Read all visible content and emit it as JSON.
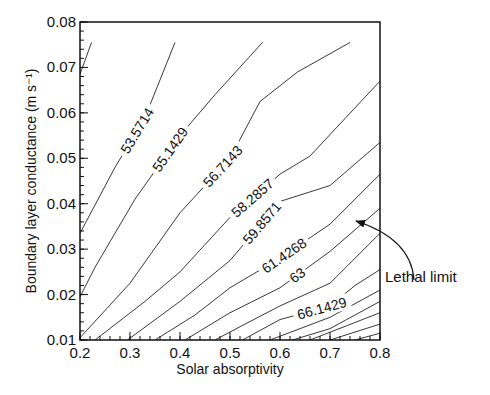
{
  "chart_data": {
    "type": "contour",
    "title": "",
    "xlabel": "Solar absorptivity",
    "ylabel": "Boundary layer conductance (m s⁻¹)",
    "xlim": [
      0.2,
      0.8
    ],
    "ylim": [
      0.01,
      0.08
    ],
    "xticks": [
      "0.2",
      "0.3",
      "0.4",
      "0.5",
      "0.6",
      "0.7",
      "0.8"
    ],
    "yticks": [
      "0.01",
      "0.02",
      "0.03",
      "0.04",
      "0.05",
      "0.06",
      "0.07",
      "0.08"
    ],
    "grid": false,
    "levels": [
      {
        "value": 52.0,
        "label": "",
        "points": [
          [
            0.2,
            0.0685
          ],
          [
            0.223,
            0.0755
          ]
        ]
      },
      {
        "value": 53.5714,
        "label": "53.5714",
        "points": [
          [
            0.2,
            0.0335
          ],
          [
            0.27,
            0.048
          ],
          [
            0.33,
            0.059
          ],
          [
            0.39,
            0.0755
          ]
        ]
      },
      {
        "value": 55.1429,
        "label": "55.1429",
        "points": [
          [
            0.2,
            0.0195
          ],
          [
            0.23,
            0.026
          ],
          [
            0.31,
            0.041
          ],
          [
            0.4,
            0.055
          ],
          [
            0.47,
            0.064
          ],
          [
            0.565,
            0.0755
          ]
        ]
      },
      {
        "value": 56.7143,
        "label": "56.7143",
        "points": [
          [
            0.2,
            0.0105
          ],
          [
            0.3,
            0.0225
          ],
          [
            0.4,
            0.038
          ],
          [
            0.5,
            0.05
          ],
          [
            0.56,
            0.0625
          ],
          [
            0.635,
            0.069
          ],
          [
            0.74,
            0.0755
          ]
        ]
      },
      {
        "value": 58.2857,
        "label": "58.2857",
        "points": [
          [
            0.23,
            0.01
          ],
          [
            0.33,
            0.0185
          ],
          [
            0.4,
            0.025
          ],
          [
            0.5,
            0.037
          ],
          [
            0.6,
            0.0465
          ],
          [
            0.66,
            0.0505
          ],
          [
            0.8,
            0.067
          ]
        ]
      },
      {
        "value": 59.8571,
        "label": "59.8571",
        "points": [
          [
            0.295,
            0.01
          ],
          [
            0.4,
            0.0185
          ],
          [
            0.5,
            0.0275
          ],
          [
            0.6,
            0.0405
          ],
          [
            0.7,
            0.044
          ],
          [
            0.8,
            0.0535
          ]
        ]
      },
      {
        "value": 61.4268,
        "label": "61.4268",
        "points": [
          [
            0.35,
            0.01
          ],
          [
            0.43,
            0.0155
          ],
          [
            0.5,
            0.0215
          ],
          [
            0.6,
            0.028
          ],
          [
            0.7,
            0.0355
          ],
          [
            0.8,
            0.0465
          ]
        ]
      },
      {
        "value": 63.0,
        "label": "63",
        "points": [
          [
            0.41,
            0.01
          ],
          [
            0.5,
            0.016
          ],
          [
            0.6,
            0.0215
          ],
          [
            0.7,
            0.0295
          ],
          [
            0.8,
            0.039
          ]
        ]
      },
      {
        "value": 64.5714,
        "label": "",
        "points": [
          [
            0.47,
            0.01
          ],
          [
            0.53,
            0.0135
          ],
          [
            0.6,
            0.0175
          ],
          [
            0.7,
            0.0225
          ],
          [
            0.8,
            0.0335
          ]
        ]
      },
      {
        "value": 66.1429,
        "label": "66.1429",
        "points": [
          [
            0.525,
            0.01
          ],
          [
            0.6,
            0.0145
          ],
          [
            0.7,
            0.0175
          ],
          [
            0.75,
            0.022
          ],
          [
            0.8,
            0.0255
          ]
        ]
      },
      {
        "value": 67.7143,
        "label": "",
        "points": [
          [
            0.58,
            0.01
          ],
          [
            0.7,
            0.015
          ],
          [
            0.8,
            0.021
          ]
        ]
      },
      {
        "value": 69.2857,
        "label": "",
        "points": [
          [
            0.625,
            0.01
          ],
          [
            0.7,
            0.0125
          ],
          [
            0.8,
            0.0185
          ]
        ]
      },
      {
        "value": 70.8571,
        "label": "",
        "points": [
          [
            0.66,
            0.01
          ],
          [
            0.8,
            0.016
          ]
        ]
      },
      {
        "value": 72.4286,
        "label": "",
        "points": [
          [
            0.7,
            0.01
          ],
          [
            0.8,
            0.0135
          ]
        ]
      },
      {
        "value": 74.0,
        "label": "",
        "points": [
          [
            0.75,
            0.01
          ],
          [
            0.8,
            0.0115
          ]
        ]
      }
    ],
    "annotations": [
      {
        "text": "Lethal limit",
        "arrow_to": [
          0.755,
          0.0375
        ],
        "refers_to_level": "63"
      }
    ],
    "legend": null
  }
}
